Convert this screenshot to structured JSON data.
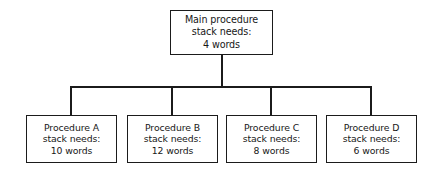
{
  "diagram": {
    "type": "tree",
    "root": {
      "id": "main-procedure",
      "lines": [
        "Main procedure",
        "stack needs:",
        "4 words"
      ],
      "name_label": "Main procedure",
      "stack_label": "stack needs:",
      "stack_words": "4 words",
      "words": 4
    },
    "children": [
      {
        "id": "procedure-a",
        "lines": [
          "Procedure A",
          "stack needs:",
          "10 words"
        ],
        "name_label": "Procedure A",
        "stack_label": "stack needs:",
        "stack_words": "10 words",
        "words": 10
      },
      {
        "id": "procedure-b",
        "lines": [
          "Procedure B",
          "stack needs:",
          "12 words"
        ],
        "name_label": "Procedure B",
        "stack_label": "stack needs:",
        "stack_words": "12 words",
        "words": 12
      },
      {
        "id": "procedure-c",
        "lines": [
          "Procedure C",
          "stack needs:",
          "8 words"
        ],
        "name_label": "Procedure C",
        "stack_label": "stack needs:",
        "stack_words": "8 words",
        "words": 8
      },
      {
        "id": "procedure-d",
        "lines": [
          "Procedure D",
          "stack needs:",
          "6 words"
        ],
        "name_label": "Procedure D",
        "stack_label": "stack needs:",
        "stack_words": "6 words",
        "words": 6
      }
    ],
    "colors": {
      "stroke": "#1b1b1b",
      "box_fill": "#ffffff",
      "text": "#171717",
      "background": "#ffffff"
    }
  }
}
